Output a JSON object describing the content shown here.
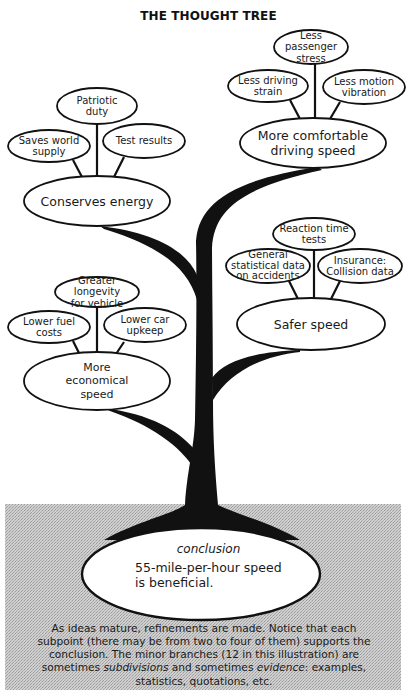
{
  "title": "THE THOUGHT TREE",
  "colors": {
    "ink": "#111111",
    "ground": "#c8c8c8",
    "ground_dot": "#a6a6a6",
    "paper": "#ffffff"
  },
  "conclusion": {
    "label": "conclusion",
    "text": "55-mile-per-hour speed is beneficial."
  },
  "branches": [
    {
      "id": "conserves-energy",
      "label": "Conserves energy",
      "subpoints": [
        {
          "label": "Saves world\nsupply"
        },
        {
          "label": "Patriotic\nduty"
        },
        {
          "label": "Test results"
        }
      ]
    },
    {
      "id": "comfortable-speed",
      "label": "More comfortable\ndriving speed",
      "subpoints": [
        {
          "label": "Less driving\nstrain"
        },
        {
          "label": "Less passenger\nstress"
        },
        {
          "label": "Less motion\nvibration"
        }
      ]
    },
    {
      "id": "economical-speed",
      "label": "More\neconomical\nspeed",
      "subpoints": [
        {
          "label": "Lower fuel\ncosts"
        },
        {
          "label": "Greater longevity\nfor vehicle"
        },
        {
          "label": "Lower car\nupkeep"
        }
      ]
    },
    {
      "id": "safer-speed",
      "label": "Safer speed",
      "subpoints": [
        {
          "label": "General\nstatistical data\non accidents"
        },
        {
          "label": "Reaction time\ntests"
        },
        {
          "label": "Insurance:\nCollision data"
        }
      ]
    }
  ],
  "caption": {
    "line1": "As ideas mature, refinements are made. Notice that each",
    "line2": "subpoint (there may be from two to four of them) supports the",
    "line3": "conclusion. The minor branches (12 in this illustration) are",
    "line4_pre": "sometimes ",
    "line4_em1": "subdivisions",
    "line4_mid": " and sometimes ",
    "line4_em2": "evidence",
    "line4_post": ": examples,",
    "line5": "statistics, quotations, etc."
  }
}
